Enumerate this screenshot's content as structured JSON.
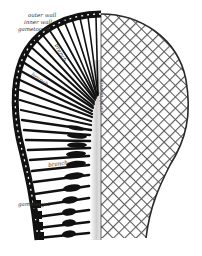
{
  "figure": {
    "colors": {
      "ink": "#111111",
      "lattice": "#6b6b6b",
      "background": "#ffffff",
      "axis_shade": "#d8d8d8"
    },
    "labels": {
      "outer_wall": "outer wall",
      "inner_wall": "inner wall",
      "gametocyst_top": "gametocyst",
      "branch_upper": "branch",
      "branch_middle": "branch",
      "branch_lower": "branch",
      "gametocyst_bottom": "gametocyst",
      "central_axis": "central axis"
    }
  }
}
